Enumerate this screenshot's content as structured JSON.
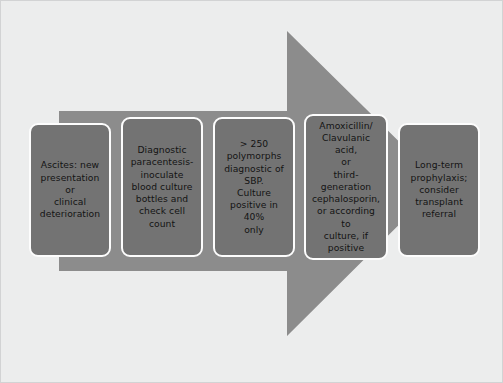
{
  "figure": {
    "background_color": "#eceded",
    "border_color": "#d2d3d4"
  },
  "arrow": {
    "name": "right-pointing-process-arrow",
    "direction": "right",
    "fill_color": "#8c8c8c",
    "shaft_top_y": 110,
    "shaft_bottom_y": 270,
    "head_top_y": 30,
    "head_bottom_y": 335,
    "head_base_x": 286,
    "tip_x": 440,
    "shaft_left_x": 58
  },
  "steps": [
    {
      "id": "step-1",
      "name": "presentation",
      "text": "Ascites: new\npresentation or\nclinical\ndeterioration",
      "fill_color": "#737373",
      "border_color": "#fdfdfd",
      "text_color": "#131313"
    },
    {
      "id": "step-2",
      "name": "diagnostic-paracentesis",
      "text": "Diagnostic\nparacentesis-\ninoculate\nblood culture\nbottles and\ncheck cell\ncount",
      "fill_color": "#737373",
      "border_color": "#fdfdfd",
      "text_color": "#131313"
    },
    {
      "id": "step-3",
      "name": "diagnosis-criteria",
      "text": "> 250\npolymorphs\ndiagnostic of\nSBP.\nCulture\npositive in 40%\nonly",
      "fill_color": "#737373",
      "border_color": "#fdfdfd",
      "text_color": "#131313"
    },
    {
      "id": "step-4",
      "name": "antibiotic-treatment",
      "text": "Amoxicillin/\nClavulanic acid,\nor\nthird-\ngeneration\ncephalosporin,\nor according to\nculture, if\npositive",
      "fill_color": "#737373",
      "border_color": "#fdfdfd",
      "text_color": "#131313"
    },
    {
      "id": "step-5",
      "name": "long-term-management",
      "text": "Long-term\nprophylaxis;\nconsider\ntransplant\nreferral",
      "fill_color": "#737373",
      "border_color": "#fdfdfd",
      "text_color": "#131313"
    }
  ]
}
